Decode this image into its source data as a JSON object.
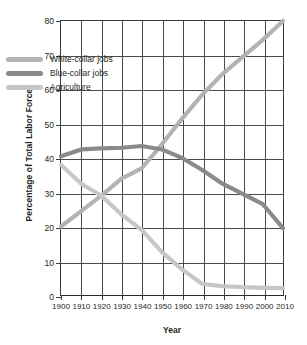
{
  "chart_data": {
    "type": "line",
    "title": "",
    "xlabel": "Year",
    "ylabel": "Percentage of Total Labor Force",
    "xlim": [
      1900,
      2010
    ],
    "ylim": [
      0,
      80
    ],
    "xticks": [
      1900,
      1910,
      1920,
      1930,
      1940,
      1950,
      1960,
      1970,
      1980,
      1990,
      2000,
      2010
    ],
    "yticks": [
      0,
      10,
      20,
      30,
      40,
      50,
      60,
      70,
      80
    ],
    "xtick_labels": [
      "1900",
      "1910",
      "1920",
      "1930",
      "1940",
      "1950",
      "1960",
      "1970",
      "1980",
      "1990",
      "2000",
      "2010"
    ],
    "ytick_labels": [
      "0",
      "10",
      "20",
      "30",
      "40",
      "50",
      "60",
      "70",
      "80"
    ],
    "grid": true,
    "legend_position": "upper-left-inside",
    "x": [
      1900,
      1910,
      1920,
      1930,
      1940,
      1950,
      1960,
      1970,
      1980,
      1990,
      2000,
      2010
    ],
    "series": [
      {
        "name": "White-collar jobs",
        "color": "#b3b3b3",
        "values": [
          20.0,
          24.5,
          29.0,
          34.0,
          37.0,
          44.0,
          51.5,
          58.5,
          64.5,
          69.5,
          74.5,
          80.0
        ]
      },
      {
        "name": "Blue-collar jobs",
        "color": "#8a8a8a",
        "values": [
          40.5,
          42.5,
          42.8,
          43.0,
          43.5,
          42.5,
          40.0,
          36.5,
          32.5,
          29.5,
          26.5,
          19.5
        ]
      },
      {
        "name": "Agriculture",
        "color": "#c7c7c7",
        "values": [
          38.0,
          32.5,
          29.0,
          23.5,
          19.0,
          12.5,
          7.5,
          3.2,
          2.6,
          2.3,
          2.1,
          2.0
        ]
      }
    ]
  },
  "legend": {
    "items": [
      {
        "label": "White-collar jobs",
        "color": "#b3b3b3"
      },
      {
        "label": "Blue-collar jobs",
        "color": "#8a8a8a"
      },
      {
        "label": "Agriculture",
        "color": "#c7c7c7"
      }
    ]
  },
  "axes": {
    "x_title": "Year",
    "y_title": "Percentage of Total Labor Force"
  },
  "colors": {
    "axis": "#3b3b3b",
    "grid": "#4a4a4a",
    "text": "#231f20",
    "background": "#ffffff"
  }
}
